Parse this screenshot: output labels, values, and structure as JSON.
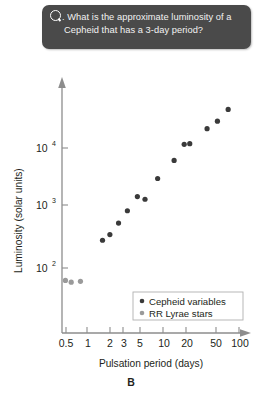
{
  "question": {
    "icon": "question-circle-icon",
    "text": "What is the approximate luminosity of a Cepheid that has a 3-day period?"
  },
  "panel_letter": "B",
  "colors": {
    "cepheid": "#3a3a3a",
    "rr_lyrae": "#9a9a9a",
    "axis": "#8d8d8d",
    "callout_bg": "#4a4a4a",
    "callout_text": "#f2f2f2",
    "page_bg": "#ffffff"
  },
  "chart_data": {
    "type": "scatter",
    "title": "",
    "xlabel": "Pulsation period (days)",
    "ylabel": "Luminosity (solar units)",
    "xscale": "log",
    "yscale": "log",
    "xlim": [
      0.45,
      130
    ],
    "ylim": [
      30,
      120000
    ],
    "grid": false,
    "legend_position": "bottom-right",
    "xticks": [
      {
        "value": 0.5,
        "label": "0.5"
      },
      {
        "value": 1,
        "label": "1"
      },
      {
        "value": 2,
        "label": "2"
      },
      {
        "value": 3,
        "label": "3"
      },
      {
        "value": 5,
        "label": "5"
      },
      {
        "value": 10,
        "label": "10"
      },
      {
        "value": 20,
        "label": "20"
      },
      {
        "value": 50,
        "label": "50"
      },
      {
        "value": 100,
        "label": "100"
      }
    ],
    "yticks": [
      {
        "value": 100,
        "label": "10",
        "exponent": "2"
      },
      {
        "value": 1000,
        "label": "10",
        "exponent": "3"
      },
      {
        "value": 10000,
        "label": "10",
        "exponent": "4"
      }
    ],
    "series": [
      {
        "name": "Cepheid variables",
        "marker": "filled-circle",
        "color": "#3a3a3a",
        "points": [
          {
            "x": 1.6,
            "y": 290
          },
          {
            "x": 2.0,
            "y": 360
          },
          {
            "x": 2.6,
            "y": 560
          },
          {
            "x": 3.4,
            "y": 900
          },
          {
            "x": 4.6,
            "y": 1550
          },
          {
            "x": 5.8,
            "y": 1400
          },
          {
            "x": 8.5,
            "y": 3100
          },
          {
            "x": 14.0,
            "y": 6200
          },
          {
            "x": 19.0,
            "y": 11500
          },
          {
            "x": 22.5,
            "y": 11800
          },
          {
            "x": 38.0,
            "y": 21000
          },
          {
            "x": 52.0,
            "y": 28000
          },
          {
            "x": 72.0,
            "y": 44000
          }
        ]
      },
      {
        "name": "RR Lyrae stars",
        "marker": "filled-circle",
        "color": "#9a9a9a",
        "points": [
          {
            "x": 0.52,
            "y": 62
          },
          {
            "x": 0.62,
            "y": 58
          },
          {
            "x": 0.82,
            "y": 60
          }
        ]
      }
    ]
  }
}
